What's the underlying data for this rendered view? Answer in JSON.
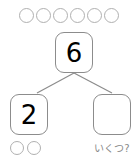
{
  "worksheet": {
    "type": "number-bond-decomposition",
    "total_box": {
      "value": "6",
      "empty": false
    },
    "part_boxes": [
      {
        "value": "2",
        "empty": false,
        "position": "left"
      },
      {
        "value": "",
        "empty": true,
        "position": "right"
      }
    ],
    "prompt_label": "いくつ?",
    "top_counters": {
      "count": 6,
      "icon": "circle-counter-icon"
    },
    "left_counters": {
      "count": 2,
      "icon": "circle-counter-icon"
    },
    "colors": {
      "background": "#ffffff",
      "box_border": "#8c8c8c",
      "counter_border": "#b0b0b0",
      "connector_line": "#8c8c8c",
      "number_text": "#000000",
      "prompt_text": "#8a8a8a"
    }
  }
}
